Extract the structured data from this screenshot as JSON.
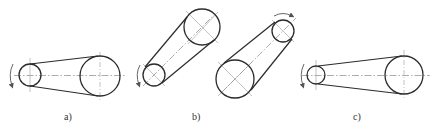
{
  "figure": {
    "colors": {
      "outline": "#2b2b2b",
      "centerline": "#8a8a8a",
      "background": "#ffffff"
    },
    "panels": [
      {
        "id": "a",
        "label": "a)",
        "label_pos": [
          68,
          120
        ],
        "small_pulley": {
          "cx": 30,
          "cy": 75,
          "r": 11
        },
        "large_pulley": {
          "cx": 100,
          "cy": 76,
          "r": 20
        },
        "rotation_arrow": {
          "side": "left-of-small",
          "direction": "counterclockwise-down"
        },
        "centerline_orientation": "horizontal"
      },
      {
        "id": "b",
        "label": "b)",
        "label_pos": [
          197,
          120
        ],
        "sub_drives": [
          {
            "small_pulley": {
              "cx": 154,
              "cy": 75,
              "r": 11
            },
            "large_pulley": {
              "cx": 202,
              "cy": 27,
              "r": 18
            },
            "rotation_arrow": {
              "side": "left-of-small",
              "direction": "counterclockwise-down"
            },
            "centerline_orientation": "diagonal-up-right"
          },
          {
            "small_pulley": {
              "cx": 283,
              "cy": 31,
              "r": 11
            },
            "large_pulley": {
              "cx": 235,
              "cy": 79,
              "r": 19
            },
            "rotation_arrow": {
              "side": "above-small",
              "direction": "clockwise-right"
            },
            "centerline_orientation": "diagonal-up-right"
          }
        ]
      },
      {
        "id": "c",
        "label": "c)",
        "label_pos": [
          357,
          120
        ],
        "small_pulley": {
          "cx": 316,
          "cy": 75,
          "r": 9
        },
        "large_pulley": {
          "cx": 404,
          "cy": 75,
          "r": 19
        },
        "rotation_arrow": {
          "side": "left-of-small",
          "direction": "counterclockwise-down"
        },
        "centerline_orientation": "horizontal"
      }
    ]
  }
}
